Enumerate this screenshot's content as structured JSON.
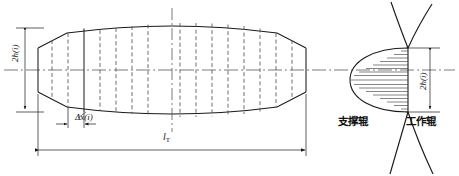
{
  "figure": {
    "type": "engineering-diagram",
    "background_color": "#ffffff",
    "line_color": "#1a1a1a",
    "dashed_color": "#555555",
    "width": 459,
    "height": 176
  },
  "labels": {
    "strip_thickness_left": "2h(i)",
    "strip_thickness_right": "2h(i)",
    "element_width": "Δx(i)",
    "total_length_symbol": "l",
    "total_length_subscript": "T",
    "backup_roll": "支撑辊",
    "work_roll": "工作辊"
  },
  "left_profile": {
    "description": "Lens / barrel shaped strip cross-section divided into vertical elements",
    "x_start": 38,
    "x_end": 306,
    "centerline_y": 70,
    "end_half_height": 22,
    "max_half_height": 45,
    "solid_division_x": 84,
    "dashed_division_count": 14,
    "dashed_divisions_x": [
      52,
      68,
      100,
      116,
      132,
      148,
      164,
      180,
      196,
      212,
      228,
      244,
      260,
      276,
      292
    ],
    "left_trapezoid_corner_x": 67,
    "right_trapezoid_corner_x": 277
  },
  "dimensions": {
    "vertical_2hi_left": {
      "x": 25,
      "y_top": 28,
      "y_bottom": 112
    },
    "horizontal_delta_x": {
      "y": 124,
      "x_left": 64,
      "x_right": 100
    },
    "horizontal_lt": {
      "y": 150,
      "x_left": 38,
      "x_right": 306
    },
    "vertical_2hi_right": {
      "x": 430,
      "y_top": 48,
      "y_bottom": 112
    }
  },
  "right_detail": {
    "description": "Parabolic contact-pressure distribution with horizontal hatching between work roll and backup roll",
    "apex_x": 352,
    "base_x": 408,
    "centerline_y": 80,
    "half_height": 32,
    "hatch_line_count": 17,
    "roll_contact_x": 408
  },
  "centerline": {
    "y": 70,
    "x_start": 4,
    "x_end": 455,
    "style": "dash-dot"
  }
}
